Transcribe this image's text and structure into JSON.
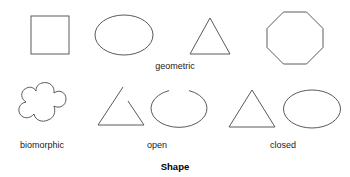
{
  "figure": {
    "title": "Shape",
    "stroke_color": "#5a5a5a",
    "text_color": "#1a1a1a",
    "background_color": "#ffffff"
  },
  "rows": [
    {
      "name": "geometric-row",
      "label": "geometric",
      "shapes": [
        "square",
        "ellipse",
        "triangle",
        "octagon"
      ]
    },
    {
      "name": "biomorphic-row",
      "label_biomorphic": "biomorphic",
      "label_open": "open",
      "label_closed": "closed",
      "shapes": [
        "biomorphic-blob",
        "open-triangle",
        "open-ellipse",
        "closed-triangle",
        "closed-ellipse"
      ]
    }
  ],
  "labels": {
    "geometric": "geometric",
    "biomorphic": "biomorphic",
    "open": "open",
    "closed": "closed"
  }
}
